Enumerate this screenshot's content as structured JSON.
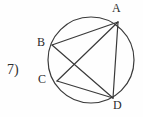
{
  "figure": {
    "problem_number": "7)",
    "background_color": "#fefefe",
    "stroke_color": "#3a3a3a",
    "label_color": "#2b2b2b",
    "circle": {
      "cx": 91,
      "cy": 60,
      "r": 43,
      "stroke_width": 1.2
    },
    "points": [
      {
        "name": "A",
        "label": "A",
        "x": 118,
        "y": 22,
        "label_x": 112,
        "label_y": 2
      },
      {
        "name": "B",
        "label": "B",
        "x": 52,
        "y": 45,
        "label_x": 37,
        "label_y": 36
      },
      {
        "name": "C",
        "label": "C",
        "x": 57,
        "y": 81,
        "label_x": 38,
        "label_y": 73
      },
      {
        "name": "D",
        "label": "D",
        "x": 113,
        "y": 98,
        "label_x": 113,
        "label_y": 99
      }
    ],
    "chords": [
      {
        "name": "chord-B-A",
        "from": "B",
        "to": "A",
        "x1": 52,
        "y1": 45,
        "x2": 118,
        "y2": 22
      },
      {
        "name": "chord-B-D",
        "from": "B",
        "to": "D",
        "x1": 52,
        "y1": 45,
        "x2": 113,
        "y2": 98
      },
      {
        "name": "chord-C-A",
        "from": "C",
        "to": "A",
        "x1": 57,
        "y1": 81,
        "x2": 118,
        "y2": 22
      },
      {
        "name": "chord-C-D",
        "from": "C",
        "to": "D",
        "x1": 57,
        "y1": 81,
        "x2": 113,
        "y2": 98
      },
      {
        "name": "chord-A-D",
        "from": "A",
        "to": "D",
        "x1": 118,
        "y1": 22,
        "x2": 113,
        "y2": 98
      }
    ]
  }
}
